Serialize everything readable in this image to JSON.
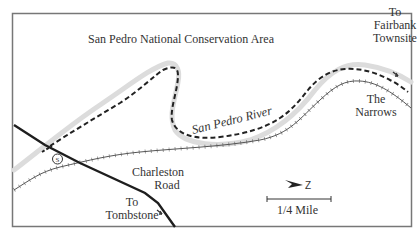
{
  "map": {
    "title": "San Pedro National Conservation Area",
    "labels": {
      "fairbank": [
        "To",
        "Fairbank",
        "Townsite"
      ],
      "narrows": [
        "The",
        "Narrows"
      ],
      "river": "San Pedro River",
      "road": [
        "Charleston",
        "Road"
      ],
      "tombstone": [
        "To",
        "Tombstone"
      ],
      "scale": "1/4 Mile",
      "north": "Z"
    },
    "symbols": {
      "trailhead": "S"
    },
    "colors": {
      "frame": "#777777",
      "trail": "#222222",
      "road": "#1e1e1e",
      "river": "#555555",
      "halo": "#dcdcdc"
    },
    "legend": {
      "trail": "dashed line",
      "river": "tick-marked line",
      "road": "solid thick line"
    }
  }
}
